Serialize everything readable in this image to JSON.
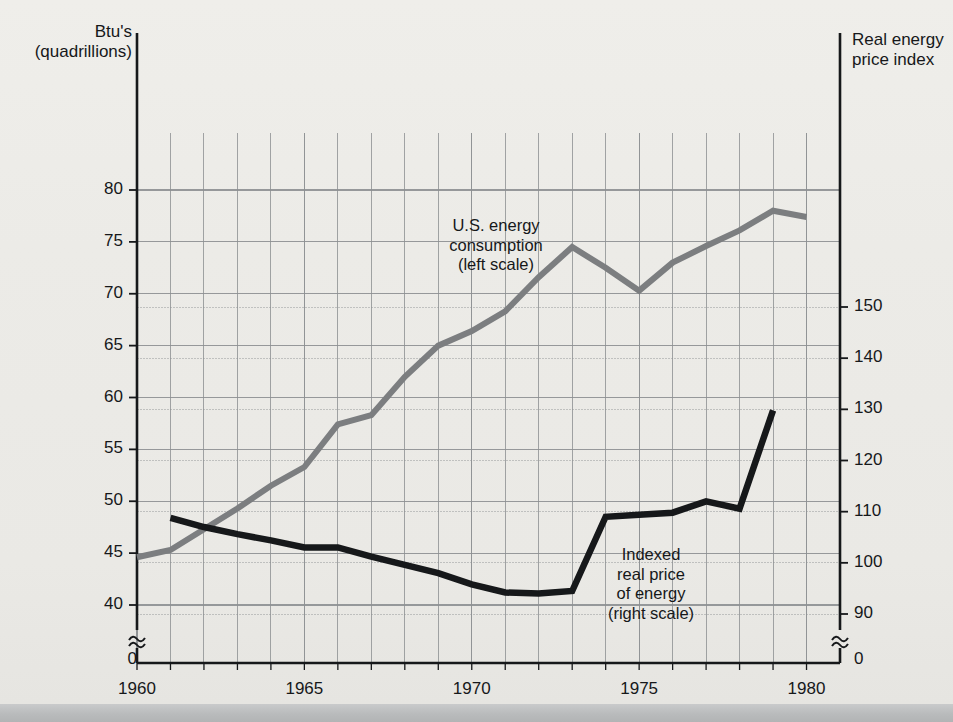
{
  "axis_titles": {
    "left": "Btu's\n(quadrillions)",
    "right": "Real energy\nprice index"
  },
  "annotations": {
    "consumption": "U.S. energy\nconsumption\n(left scale)",
    "price": "Indexed\nreal price\nof energy\n(right scale)"
  },
  "colors": {
    "background": "#ecebe7",
    "consumption_line": "#7c7e80",
    "price_line": "#16181a",
    "grid": "#8d9092",
    "axis": "#16181a"
  },
  "chart_data": {
    "type": "line",
    "title": "",
    "xlabel": "",
    "ylabel": "Btu's (quadrillions)",
    "y2label": "Real energy price index",
    "grid": true,
    "legend": "inline-annotations",
    "xlim": [
      1960,
      1981
    ],
    "xticks": [
      1960,
      1965,
      1970,
      1975,
      1980
    ],
    "xtick_step_minor": 1,
    "ylim_left": [
      38.5,
      82.5
    ],
    "yticks_left": [
      40,
      45,
      50,
      55,
      60,
      65,
      70,
      75,
      80
    ],
    "ylim_right": [
      88,
      156
    ],
    "yticks_right": [
      90,
      100,
      110,
      120,
      130,
      140,
      150
    ],
    "axis_break_left_label": "0",
    "axis_break_right_label": "0",
    "series": [
      {
        "name": "U.S. energy consumption (left scale)",
        "axis": "left",
        "color": "#7c7e80",
        "x": [
          1960,
          1961,
          1962,
          1963,
          1964,
          1965,
          1966,
          1967,
          1968,
          1969,
          1970,
          1971,
          1972,
          1973,
          1974,
          1975,
          1976,
          1977,
          1978,
          1979,
          1980
        ],
        "values": [
          44.6,
          45.3,
          47.3,
          49.3,
          51.5,
          53.3,
          57.4,
          58.3,
          62.0,
          65.0,
          66.4,
          68.3,
          71.6,
          74.5,
          72.5,
          70.3,
          73.0,
          74.6,
          76.1,
          78.0,
          77.4
        ]
      },
      {
        "name": "Indexed real price of energy (right scale)",
        "axis": "right",
        "color": "#16181a",
        "x": [
          1961,
          1962,
          1963,
          1964,
          1965,
          1966,
          1967,
          1968,
          1969,
          1970,
          1971,
          1972,
          1973,
          1974,
          1975,
          1976,
          1977,
          1978,
          1979
        ],
        "values": [
          108.8,
          107.0,
          105.6,
          104.4,
          103.0,
          103.0,
          101.2,
          99.6,
          98.0,
          95.8,
          94.2,
          94.0,
          94.5,
          109.0,
          109.4,
          109.8,
          112.0,
          110.6,
          129.8
        ]
      }
    ]
  }
}
